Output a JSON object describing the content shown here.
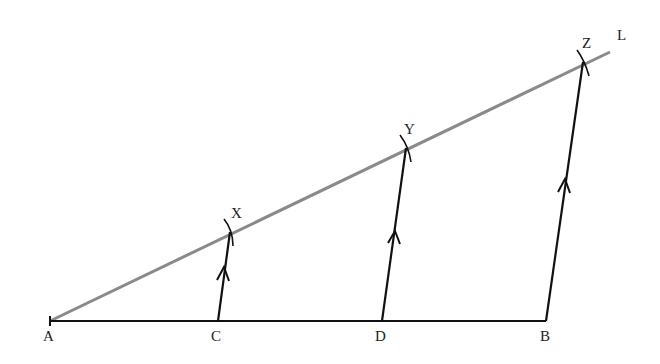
{
  "diagram": {
    "type": "geometric-construction",
    "colors": {
      "segment": "#111111",
      "ray": "#8a8a8a",
      "label": "#222222"
    },
    "points": {
      "A": {
        "label": "A",
        "x": 50,
        "y": 321
      },
      "C": {
        "label": "C",
        "x": 218,
        "y": 321
      },
      "D": {
        "label": "D",
        "x": 382,
        "y": 321
      },
      "B": {
        "label": "B",
        "x": 546,
        "y": 321
      },
      "X": {
        "label": "X",
        "x": 230,
        "y": 232
      },
      "Y": {
        "label": "Y",
        "x": 406,
        "y": 148
      },
      "Z": {
        "label": "Z",
        "x": 583,
        "y": 62
      },
      "L": {
        "label": "L",
        "x": 610,
        "y": 50
      }
    },
    "segments": [
      {
        "name": "AB",
        "from": "A",
        "to": "B"
      },
      {
        "name": "CX",
        "from": "C",
        "to": "X",
        "arrow": true
      },
      {
        "name": "DY",
        "from": "D",
        "to": "Y",
        "arrow": true
      },
      {
        "name": "BZ",
        "from": "B",
        "to": "Z",
        "arrow": true
      }
    ],
    "ray": {
      "name": "AL",
      "from": "A",
      "to": "L"
    },
    "arcs": [
      "X",
      "Y",
      "Z"
    ]
  }
}
